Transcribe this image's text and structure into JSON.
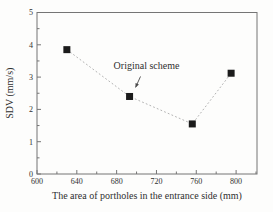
{
  "figure": {
    "background": "#fdfdfc",
    "axis_color": "#757575",
    "text_color": "#2f2f2f"
  },
  "chart_data": {
    "type": "scatter",
    "title": "",
    "xlabel": "The area of portholes in the entrance side (mm)",
    "ylabel": "SDV (mm/s)",
    "xlim": [
      600,
      821
    ],
    "ylim": [
      0,
      5
    ],
    "x_major_ticks": [
      600,
      640,
      680,
      720,
      760,
      800
    ],
    "x_minor_ticks": [
      620,
      660,
      700,
      740,
      780,
      820
    ],
    "y_major_ticks": [
      0,
      1,
      2,
      3,
      4,
      5
    ],
    "y_minor_ticks": [
      0.5,
      1.5,
      2.5,
      3.5,
      4.5
    ],
    "grid": false,
    "legend": "none",
    "series": [
      {
        "name": "SDV vs porthole area",
        "marker": "square",
        "marker_size": 7,
        "marker_color": "#1b1b1b",
        "line_style": "dotted",
        "line_color": "#b3b3b3",
        "points": [
          {
            "x": 630,
            "y": 3.85
          },
          {
            "x": 693,
            "y": 2.4
          },
          {
            "x": 756,
            "y": 1.55
          },
          {
            "x": 795,
            "y": 3.12
          }
        ]
      }
    ],
    "annotation": {
      "text": "Original scheme",
      "text_x": 710,
      "text_y": 3.31,
      "arrow_from_x": 704,
      "arrow_from_y": 3.02,
      "arrow_to_x": 699,
      "arrow_to_y": 2.68,
      "arrow_color": "#4a4a4a"
    }
  }
}
